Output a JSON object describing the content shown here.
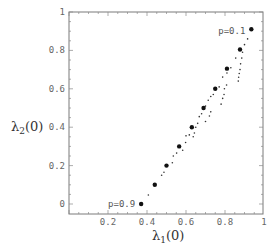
{
  "chart_data": {
    "type": "scatter",
    "title": "",
    "xlabel": "λ1(0)",
    "ylabel": "λ2(0)",
    "xlim": [
      0,
      1
    ],
    "ylim": [
      -0.05,
      1
    ],
    "x_ticks": [
      0.2,
      0.4,
      0.6,
      0.8,
      1
    ],
    "x_tick_labels": [
      "0.2",
      "0.4",
      "0.6",
      "0.8",
      "1"
    ],
    "y_ticks": [
      0,
      0.2,
      0.4,
      0.6,
      0.8,
      1
    ],
    "y_tick_labels": [
      "0",
      "0.2",
      "0.4",
      "0.6",
      "0.8",
      "1"
    ],
    "grid": false,
    "frame": true,
    "annotations": [
      {
        "text": "p=0.9",
        "x": 0.37,
        "y": 0.0,
        "anchor": "left-of-point"
      },
      {
        "text": "p=0.1",
        "x": 0.935,
        "y": 0.9,
        "anchor": "left-of-point"
      }
    ],
    "series": [
      {
        "name": "main points (p = 0.9 … 0.1)",
        "marker": "large-dot",
        "points": [
          {
            "p": 0.9,
            "x": 0.37,
            "y": 0.0
          },
          {
            "p": 0.8,
            "x": 0.44,
            "y": 0.1
          },
          {
            "p": 0.7,
            "x": 0.5,
            "y": 0.2
          },
          {
            "p": 0.6,
            "x": 0.565,
            "y": 0.3
          },
          {
            "p": 0.5,
            "x": 0.63,
            "y": 0.4
          },
          {
            "p": 0.4,
            "x": 0.69,
            "y": 0.5
          },
          {
            "p": 0.3,
            "x": 0.75,
            "y": 0.6
          },
          {
            "p": 0.2,
            "x": 0.81,
            "y": 0.705
          },
          {
            "p": 0.1,
            "x": 0.877,
            "y": 0.805
          },
          {
            "p": 0.0,
            "x": 0.935,
            "y": 0.91
          }
        ]
      },
      {
        "name": "secondary points",
        "marker": "small-dot",
        "points": [
          {
            "x": 0.407,
            "y": 0.047
          },
          {
            "x": 0.475,
            "y": 0.15
          },
          {
            "x": 0.487,
            "y": 0.165
          },
          {
            "x": 0.53,
            "y": 0.215
          },
          {
            "x": 0.535,
            "y": 0.25
          },
          {
            "x": 0.552,
            "y": 0.265
          },
          {
            "x": 0.583,
            "y": 0.28
          },
          {
            "x": 0.598,
            "y": 0.32
          },
          {
            "x": 0.6,
            "y": 0.355
          },
          {
            "x": 0.617,
            "y": 0.36
          },
          {
            "x": 0.637,
            "y": 0.35
          },
          {
            "x": 0.643,
            "y": 0.37
          },
          {
            "x": 0.65,
            "y": 0.4
          },
          {
            "x": 0.66,
            "y": 0.42
          },
          {
            "x": 0.668,
            "y": 0.455
          },
          {
            "x": 0.68,
            "y": 0.47
          },
          {
            "x": 0.7,
            "y": 0.43
          },
          {
            "x": 0.72,
            "y": 0.458
          },
          {
            "x": 0.727,
            "y": 0.48
          },
          {
            "x": 0.7,
            "y": 0.51
          },
          {
            "x": 0.714,
            "y": 0.54
          },
          {
            "x": 0.727,
            "y": 0.56
          },
          {
            "x": 0.74,
            "y": 0.57
          },
          {
            "x": 0.77,
            "y": 0.61
          },
          {
            "x": 0.78,
            "y": 0.52
          },
          {
            "x": 0.788,
            "y": 0.55
          },
          {
            "x": 0.795,
            "y": 0.57
          },
          {
            "x": 0.797,
            "y": 0.6
          },
          {
            "x": 0.808,
            "y": 0.62
          },
          {
            "x": 0.788,
            "y": 0.661
          },
          {
            "x": 0.81,
            "y": 0.682
          },
          {
            "x": 0.83,
            "y": 0.71
          },
          {
            "x": 0.855,
            "y": 0.76
          },
          {
            "x": 0.868,
            "y": 0.64
          },
          {
            "x": 0.87,
            "y": 0.66
          },
          {
            "x": 0.873,
            "y": 0.68
          },
          {
            "x": 0.877,
            "y": 0.7
          },
          {
            "x": 0.88,
            "y": 0.73
          },
          {
            "x": 0.886,
            "y": 0.76
          },
          {
            "x": 0.89,
            "y": 0.79
          },
          {
            "x": 0.9,
            "y": 0.83
          },
          {
            "x": 0.916,
            "y": 0.86
          }
        ]
      }
    ]
  },
  "colors": {
    "frame": "#7a7a7a",
    "tick": "#8a8a8a",
    "large_dot": "#111111",
    "small_dot": "#333333",
    "background": "#ffffff"
  }
}
